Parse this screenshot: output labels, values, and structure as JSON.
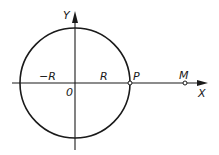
{
  "diagram": {
    "type": "circle-on-axes",
    "colors": {
      "stroke": "#1a1a1a",
      "background": "#ffffff"
    },
    "axes": {
      "x_label": "X",
      "y_label": "Y",
      "origin_label": "0"
    },
    "circle": {
      "center_label": "0",
      "radius_label_positive": "R",
      "radius_label_negative": "−R"
    },
    "points": [
      {
        "name": "P",
        "label": "P",
        "description": "point on circle at +R on X axis"
      },
      {
        "name": "M",
        "label": "M",
        "description": "point on X axis outside circle"
      }
    ]
  }
}
